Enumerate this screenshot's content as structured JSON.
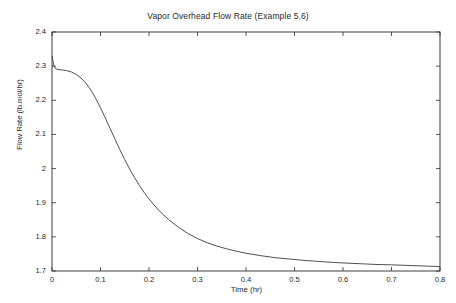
{
  "figure": {
    "background_color": "#ffffff",
    "axis_color": "#2b2b2b",
    "line_color": "#3c3c3c"
  },
  "chart_data": {
    "type": "line",
    "title": "Vapor Overhead Flow Rate (Example 5.6)",
    "xlabel": "Time (hr)",
    "ylabel": "Flow Rate (lb.mol/hr)",
    "xlim": [
      0,
      0.8
    ],
    "ylim": [
      1.7,
      2.4
    ],
    "grid": false,
    "legend": null,
    "xticks": [
      0,
      0.1,
      0.2,
      0.3,
      0.4,
      0.5,
      0.6,
      0.7,
      0.8
    ],
    "xticklabels": [
      "0",
      "0.1",
      "0.2",
      "0.3",
      "0.4",
      "0.5",
      "0.6",
      "0.7",
      "0.8"
    ],
    "yticks": [
      1.7,
      1.8,
      1.9,
      2.0,
      2.1,
      2.2,
      2.3,
      2.4
    ],
    "yticklabels": [
      "1.7",
      "1.8",
      "1.9",
      "2",
      "2.1",
      "2.2",
      "2.3",
      "2.4"
    ],
    "series": [
      {
        "name": "Vapor overhead flow rate",
        "x": [
          0.0,
          0.004,
          0.008,
          0.012,
          0.02,
          0.03,
          0.04,
          0.05,
          0.06,
          0.07,
          0.08,
          0.09,
          0.1,
          0.11,
          0.12,
          0.13,
          0.14,
          0.15,
          0.16,
          0.17,
          0.18,
          0.19,
          0.2,
          0.22,
          0.24,
          0.26,
          0.28,
          0.3,
          0.32,
          0.34,
          0.36,
          0.38,
          0.4,
          0.43,
          0.46,
          0.49,
          0.52,
          0.55,
          0.58,
          0.61,
          0.64,
          0.67,
          0.7,
          0.74,
          0.8
        ],
        "y": [
          2.33,
          2.3,
          2.292,
          2.29,
          2.289,
          2.287,
          2.283,
          2.276,
          2.265,
          2.25,
          2.23,
          2.206,
          2.178,
          2.148,
          2.117,
          2.086,
          2.055,
          2.026,
          1.999,
          1.974,
          1.951,
          1.93,
          1.911,
          1.878,
          1.851,
          1.829,
          1.81,
          1.795,
          1.783,
          1.773,
          1.765,
          1.758,
          1.752,
          1.745,
          1.739,
          1.735,
          1.731,
          1.728,
          1.725,
          1.723,
          1.721,
          1.719,
          1.718,
          1.716,
          1.713
        ]
      }
    ],
    "annotations": {
      "initial_spike_value": 2.33,
      "plateau_value": 2.29,
      "asymptote_value": 1.713
    }
  }
}
